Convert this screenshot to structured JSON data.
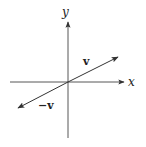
{
  "diagram": {
    "title": "",
    "axes": {
      "x_label": "x",
      "y_label": "y"
    },
    "vectors": [
      {
        "name": "v",
        "label": "v",
        "from": [
          0,
          0
        ],
        "to": [
          50,
          25
        ]
      },
      {
        "name": "neg-v",
        "label": "−v",
        "from": [
          0,
          0
        ],
        "to": [
          -50,
          -25
        ]
      }
    ],
    "colors": {
      "stroke": "#333333",
      "background": "#ffffff"
    }
  }
}
